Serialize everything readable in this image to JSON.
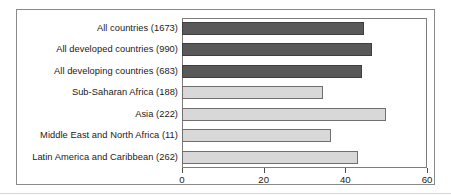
{
  "chart_data": {
    "type": "bar",
    "orientation": "horizontal",
    "title": "",
    "subtitle": "",
    "xlabel": "",
    "ylabel": "",
    "xlim": [
      0,
      60
    ],
    "ylim": null,
    "grid": false,
    "legend": null,
    "xticks": [
      0,
      20,
      40,
      60
    ],
    "xtick_labels": [
      "0",
      "20",
      "40",
      "60"
    ],
    "categories": [
      "All countries (1673)",
      "All developed countries (990)",
      "All developing countries (683)",
      "Sub-Saharan Africa (188)",
      "Asia (222)",
      "Middle East and North Africa (11)",
      "Latin America and Caribbean (262)"
    ],
    "values": [
      44.5,
      46.5,
      44.0,
      34.5,
      50.0,
      36.5,
      43.0
    ],
    "bar_styles": [
      "dark",
      "dark",
      "dark",
      "light",
      "light",
      "light",
      "light"
    ],
    "colors": {
      "dark": "#595959",
      "light": "#d8d8d8",
      "bar_border": "#6f6f6f",
      "axis": "#7d7d7d",
      "frame": "#8a8a8a",
      "text": "#1a1a1a",
      "background": "#ffffff"
    }
  }
}
